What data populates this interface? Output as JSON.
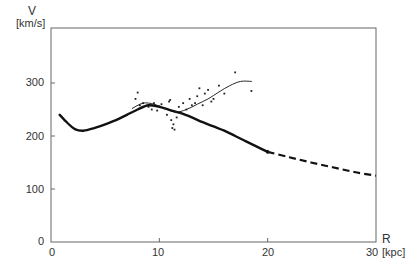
{
  "chart_data": {
    "type": "line",
    "title": "",
    "xlabel": "R",
    "xunit": "[kpc]",
    "ylabel": "V",
    "yunit": "[km/s]",
    "xlim": [
      0,
      30
    ],
    "ylim": [
      0,
      300
    ],
    "x_ticks": [
      "0",
      "10",
      "20",
      "30"
    ],
    "y_ticks": [
      "0",
      "100",
      "200",
      "300"
    ],
    "grid": false,
    "legend": null,
    "series": [
      {
        "name": "model rotation curve (thick)",
        "style": "solid-thick",
        "x": [
          0.8,
          1.5,
          2.2,
          3.0,
          4.0,
          5.0,
          6.0,
          7.0,
          8.0,
          9.0,
          10.0,
          11.0,
          12.0,
          13.0,
          14.0,
          15.0,
          16.0,
          17.0,
          18.0,
          19.0,
          20.0
        ],
        "y": [
          240,
          225,
          213,
          210,
          215,
          222,
          230,
          240,
          250,
          258,
          255,
          249,
          243,
          235,
          226,
          218,
          210,
          200,
          190,
          180,
          170
        ]
      },
      {
        "name": "model extrapolation (dashed)",
        "style": "dashed-thick",
        "x": [
          20,
          22,
          24,
          26,
          28,
          30
        ],
        "y": [
          170,
          160,
          150,
          141,
          132,
          125
        ]
      },
      {
        "name": "observed fit (thin)",
        "style": "solid-thin",
        "x": [
          7.5,
          8.5,
          9.5,
          10.5,
          11.5,
          12.5,
          13.5,
          14.5,
          15.5,
          16.5,
          17.5,
          18.5
        ],
        "y": [
          252,
          262,
          260,
          252,
          245,
          250,
          260,
          270,
          283,
          295,
          303,
          303
        ]
      },
      {
        "name": "observations (scatter)",
        "style": "points",
        "x": [
          7.8,
          8.0,
          8.2,
          8.5,
          9.0,
          9.3,
          9.5,
          9.8,
          10.0,
          10.2,
          10.5,
          10.7,
          10.9,
          11.0,
          11.1,
          11.2,
          11.3,
          11.4,
          11.5,
          11.6,
          11.8,
          12.0,
          12.2,
          12.5,
          12.8,
          13.0,
          13.3,
          13.5,
          13.7,
          14.0,
          14.2,
          14.5,
          14.8,
          15.0,
          15.5,
          16.0,
          17.0,
          18.5
        ],
        "y": [
          270,
          282,
          258,
          262,
          255,
          250,
          262,
          248,
          256,
          260,
          252,
          240,
          265,
          268,
          230,
          215,
          222,
          212,
          245,
          235,
          255,
          243,
          262,
          250,
          270,
          258,
          262,
          275,
          290,
          258,
          280,
          287,
          265,
          270,
          295,
          280,
          320,
          285
        ]
      }
    ]
  },
  "labels": {
    "v": "V",
    "v_unit": "[km/s]",
    "r": "R",
    "r_unit": "[kpc]"
  }
}
